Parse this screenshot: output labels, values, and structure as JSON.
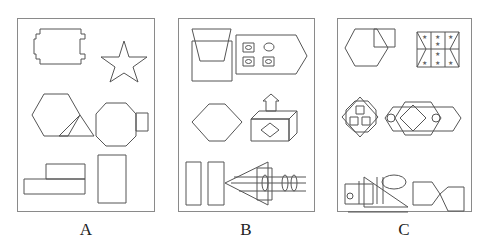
{
  "figure": {
    "panels": [
      {
        "label": "A",
        "shapes": [
          "notched-rectangle",
          "star",
          "hexagon-with-triangle",
          "octagon-with-square",
          "stacked-rectangles",
          "tall-rectangle"
        ]
      },
      {
        "label": "B",
        "shapes": [
          "trapezoid-over-square",
          "pentagon-with-windows",
          "elongated-hexagon",
          "box-with-arrow-and-diamond",
          "two-tall-rectangles",
          "arrow-with-lines-and-ellipses"
        ]
      },
      {
        "label": "C",
        "shapes": [
          "hexagon-with-square",
          "star-grid-rectangle",
          "octagon-diamond-squares",
          "overlapping-octagons-diamond",
          "ruler-triangle-ellipse",
          "pentagon-pair"
        ]
      }
    ],
    "stroke_color": "#555555",
    "border_color": "#8a8a8a"
  }
}
